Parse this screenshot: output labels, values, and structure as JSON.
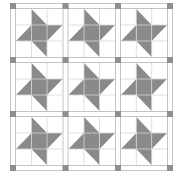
{
  "quilt": {
    "title": "Friendship Star Quilt",
    "rows": 3,
    "cols": 3,
    "colors": {
      "background": "#ffffff",
      "star": "#8a8a8a",
      "cornerstone": "#8e8e8e",
      "sashing_line": "#c4c4c4",
      "grid_line": "#d6d6d6"
    },
    "cornerstone_x": [
      10,
      62.5,
      115,
      167
    ],
    "cornerstone_y": [
      3,
      57,
      111,
      165
    ],
    "cornerstone_size": 6
  }
}
